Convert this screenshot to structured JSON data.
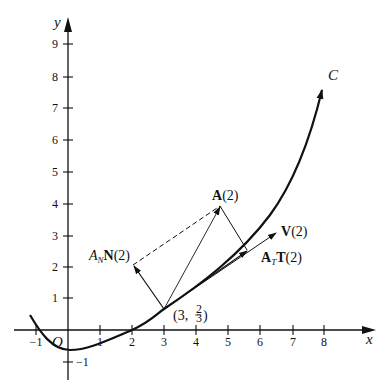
{
  "diagram": {
    "curve_label": "C",
    "origin_label": "O",
    "axes": {
      "x_label": "x",
      "y_label": "y",
      "x_ticks": [
        "−1",
        "1",
        "2",
        "3",
        "4",
        "5",
        "6",
        "7",
        "8"
      ],
      "y_ticks": [
        "−1",
        "1",
        "2",
        "3",
        "4",
        "5",
        "6",
        "7",
        "8",
        "9"
      ]
    },
    "point": {
      "label": "(3, 2/3)",
      "x": 3,
      "y": "2/3"
    },
    "vectors": {
      "acceleration": {
        "symbol": "A",
        "arg": "(2)"
      },
      "velocity": {
        "symbol": "V",
        "arg": "(2)"
      },
      "tangential": {
        "coef": "A",
        "coef_sub": "T",
        "symbol": "T",
        "arg": "(2)"
      },
      "normal": {
        "coef": "A",
        "coef_sub": "N",
        "symbol": "N",
        "arg": "(2)"
      }
    }
  }
}
